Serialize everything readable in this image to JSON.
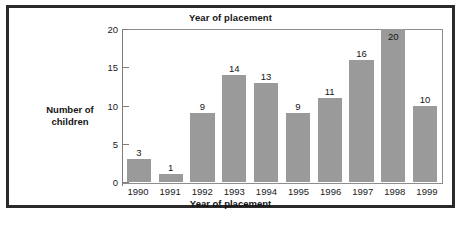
{
  "chart_data": {
    "type": "bar",
    "title": "Year of placement",
    "xlabel": "Year of placement",
    "ylabel": "Number of children",
    "ylabel_lines": [
      "Number of",
      "children"
    ],
    "categories": [
      "1990",
      "1991",
      "1992",
      "1993",
      "1994",
      "1995",
      "1996",
      "1997",
      "1998",
      "1999"
    ],
    "values": [
      3,
      1,
      9,
      14,
      13,
      9,
      11,
      16,
      20,
      10
    ],
    "value_labels": [
      "3",
      "1",
      "9",
      "14",
      "13",
      "9",
      "11",
      "16",
      "20",
      "10"
    ],
    "value_label_position": [
      "outside",
      "outside",
      "outside",
      "outside",
      "outside",
      "outside",
      "outside",
      "outside",
      "inside",
      "outside"
    ],
    "ylim": [
      0,
      20
    ],
    "ytick_values": [
      0,
      5,
      10,
      15,
      20
    ],
    "ytick_labels": [
      "0",
      "5",
      "10",
      "15",
      "20"
    ],
    "grid": false,
    "legend": false,
    "bar_color": "#9a9a9a",
    "axis_color": "#7c7c7c",
    "text_color": "#141414",
    "frame_color": "#2a2a2a",
    "background": "#ffffff"
  }
}
